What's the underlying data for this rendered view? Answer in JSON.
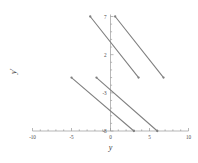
{
  "chart_data": {
    "type": "line",
    "title": "",
    "xlabel": "y",
    "ylabel": "y'",
    "xlim": [
      -10,
      10
    ],
    "ylim": [
      -8,
      7
    ],
    "grid": false,
    "legend": null,
    "xticks": [
      -10,
      -5,
      0,
      5,
      10
    ],
    "xticklabels": [
      "-10",
      "-5",
      "0",
      "5",
      "10"
    ],
    "yticks": [
      -8,
      -3,
      2,
      7
    ],
    "yticklabels": [
      "-8",
      "-3",
      "2",
      "7"
    ],
    "marker": "dot-endpoints",
    "series": [
      {
        "name": "segment-1",
        "x": [
          -2.6,
          3.6
        ],
        "y": [
          7.0,
          -1.0
        ]
      },
      {
        "name": "segment-2",
        "x": [
          0.6,
          6.8
        ],
        "y": [
          7.0,
          -1.0
        ]
      },
      {
        "name": "segment-3",
        "x": [
          -5.0,
          3.0
        ],
        "y": [
          -1.0,
          -8.0
        ]
      },
      {
        "name": "segment-4",
        "x": [
          -1.8,
          6.0
        ],
        "y": [
          -1.0,
          -8.0
        ]
      }
    ]
  },
  "axis_labels": {
    "x_title": "y",
    "y_title": "y'"
  },
  "colors": {
    "line": "#808080",
    "axis": "#9a9a9a",
    "text": "#4a4a4a",
    "background": "#ffffff"
  }
}
